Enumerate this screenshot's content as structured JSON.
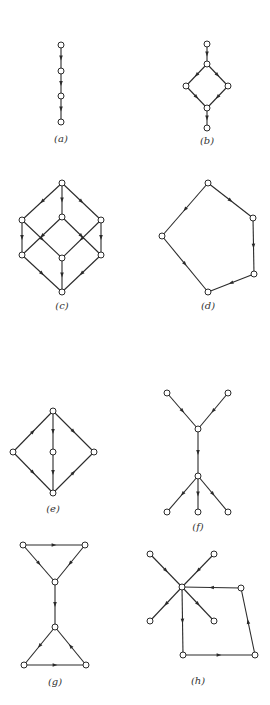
{
  "figures": [
    {
      "id": "a",
      "caption": "(a)",
      "caption_pos": [
        61,
        140
      ],
      "nodes": [
        [
          61,
          45
        ],
        [
          61,
          71
        ],
        [
          61,
          96
        ],
        [
          61,
          122
        ]
      ],
      "edges": [
        [
          0,
          1
        ],
        [
          1,
          2
        ],
        [
          2,
          3
        ]
      ]
    },
    {
      "id": "b",
      "caption": "(b)",
      "caption_pos": [
        207,
        142
      ],
      "nodes": [
        [
          207,
          44
        ],
        [
          207,
          64
        ],
        [
          186,
          86
        ],
        [
          228,
          86
        ],
        [
          207,
          108
        ],
        [
          207,
          128
        ]
      ],
      "edges": [
        [
          0,
          1
        ],
        [
          1,
          2
        ],
        [
          1,
          3
        ],
        [
          2,
          4
        ],
        [
          3,
          4
        ],
        [
          4,
          5
        ]
      ]
    },
    {
      "id": "c",
      "caption": "(c)",
      "caption_pos": [
        62,
        307
      ],
      "nodes": [
        [
          62,
          183
        ],
        [
          22,
          220
        ],
        [
          62,
          217
        ],
        [
          101,
          220
        ],
        [
          22,
          255
        ],
        [
          62,
          258
        ],
        [
          101,
          255
        ],
        [
          62,
          292
        ]
      ],
      "edges": [
        [
          0,
          1
        ],
        [
          0,
          2
        ],
        [
          0,
          3
        ],
        [
          1,
          4
        ],
        [
          1,
          5
        ],
        [
          2,
          4
        ],
        [
          2,
          6
        ],
        [
          3,
          5
        ],
        [
          3,
          6
        ],
        [
          4,
          7
        ],
        [
          5,
          7
        ],
        [
          6,
          7
        ]
      ]
    },
    {
      "id": "d",
      "caption": "(d)",
      "caption_pos": [
        208,
        307
      ],
      "nodes": [
        [
          208,
          183
        ],
        [
          162,
          236
        ],
        [
          253,
          218
        ],
        [
          254,
          274
        ],
        [
          208,
          292
        ]
      ],
      "edges": [
        [
          0,
          1
        ],
        [
          0,
          2
        ],
        [
          2,
          3
        ],
        [
          3,
          4
        ],
        [
          1,
          4
        ]
      ]
    },
    {
      "id": "e",
      "caption": "(e)",
      "caption_pos": [
        53,
        510
      ],
      "nodes": [
        [
          53,
          411
        ],
        [
          13,
          452
        ],
        [
          53,
          452
        ],
        [
          94,
          452
        ],
        [
          53,
          493
        ]
      ],
      "edges": [
        [
          1,
          0
        ],
        [
          0,
          2
        ],
        [
          0,
          3
        ],
        [
          1,
          4
        ],
        [
          2,
          4
        ],
        [
          4,
          3
        ]
      ]
    },
    {
      "id": "f",
      "caption": "(f)",
      "caption_pos": [
        198,
        528
      ],
      "nodes": [
        [
          167,
          393
        ],
        [
          228,
          393
        ],
        [
          198,
          429
        ],
        [
          198,
          476
        ],
        [
          167,
          512
        ],
        [
          198,
          512
        ],
        [
          228,
          512
        ]
      ],
      "edges": [
        [
          0,
          2
        ],
        [
          1,
          2
        ],
        [
          2,
          3
        ],
        [
          3,
          4
        ],
        [
          3,
          5
        ],
        [
          3,
          6
        ]
      ]
    },
    {
      "id": "g",
      "caption": "(g)",
      "caption_pos": [
        55,
        683
      ],
      "nodes": [
        [
          23,
          545
        ],
        [
          85,
          545
        ],
        [
          55,
          582
        ],
        [
          55,
          627
        ],
        [
          24,
          665
        ],
        [
          86,
          665
        ]
      ],
      "edges": [
        [
          0,
          1
        ],
        [
          0,
          2
        ],
        [
          1,
          2
        ],
        [
          2,
          3
        ],
        [
          3,
          4
        ],
        [
          5,
          3
        ],
        [
          4,
          5
        ]
      ]
    },
    {
      "id": "h",
      "caption": "(h)",
      "caption_pos": [
        198,
        682
      ],
      "nodes": [
        [
          182,
          587
        ],
        [
          150,
          554
        ],
        [
          214,
          554
        ],
        [
          150,
          621
        ],
        [
          214,
          621
        ],
        [
          241,
          588
        ],
        [
          183,
          655
        ],
        [
          255,
          655
        ]
      ],
      "edges": [
        [
          1,
          0
        ],
        [
          2,
          0
        ],
        [
          0,
          3
        ],
        [
          0,
          4
        ],
        [
          0,
          6
        ],
        [
          6,
          7
        ],
        [
          7,
          5
        ],
        [
          5,
          0
        ]
      ]
    }
  ],
  "style": {
    "line_color": "#2a2a2a",
    "node_fill": "#ffffff",
    "node_radius": 3,
    "arrow_size": 4
  }
}
